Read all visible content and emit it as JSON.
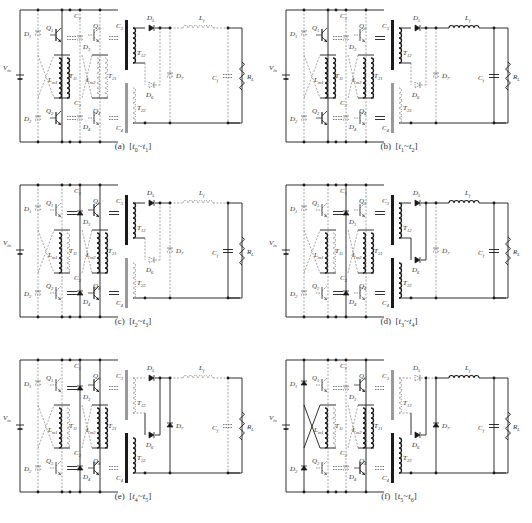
{
  "figure": {
    "panels": [
      {
        "id": "a",
        "caption": "(a)  [t0~t1]",
        "caption_parts": {
          "label": "(a)",
          "t_start": "t",
          "s_start": "0",
          "t_end": "t",
          "s_end": "1"
        },
        "active": {
          "D1": false,
          "D2": false,
          "Q1": true,
          "Q2": true,
          "Q3": false,
          "Q4": false,
          "C1": false,
          "C2": false,
          "C3": false,
          "C4": false,
          "D5": true,
          "D6": false,
          "D7": false,
          "L1": false,
          "Cf": false,
          "T12": true,
          "T22": false,
          "T21": false,
          "cross": false
        }
      },
      {
        "id": "b",
        "caption": "(b)  [t1~t2]",
        "caption_parts": {
          "label": "(b)",
          "t_start": "t",
          "s_start": "1",
          "t_end": "t",
          "s_end": "2"
        },
        "active": {
          "D1": false,
          "D2": false,
          "Q1": true,
          "Q2": true,
          "Q3": false,
          "Q4": false,
          "C1": false,
          "C2": false,
          "C3": true,
          "C4": true,
          "D5": true,
          "D6": false,
          "D7": false,
          "L1": true,
          "Cf": true,
          "T12": true,
          "T22": false,
          "T21": true,
          "cross": false
        }
      },
      {
        "id": "c",
        "caption": "(c)  [t2~t3]",
        "caption_parts": {
          "label": "(c)",
          "t_start": "t",
          "s_start": "2",
          "t_end": "t",
          "s_end": "3"
        },
        "active": {
          "D1": false,
          "D2": false,
          "Q1": false,
          "Q2": false,
          "Q3": true,
          "Q4": true,
          "C1": true,
          "C2": true,
          "C3": true,
          "C4": true,
          "D5": true,
          "D6": false,
          "D7": false,
          "L1": false,
          "Cf": true,
          "T12": true,
          "T22": false,
          "T21": true,
          "cross": false
        }
      },
      {
        "id": "d",
        "caption": "(d)  [t3~t4]",
        "caption_parts": {
          "label": "(d)",
          "t_start": "t",
          "s_start": "3",
          "t_end": "t",
          "s_end": "4"
        },
        "active": {
          "D1": false,
          "D2": false,
          "Q1": false,
          "Q2": false,
          "Q3": false,
          "Q4": false,
          "C1": true,
          "C2": true,
          "C3": true,
          "C4": true,
          "D5": true,
          "D6": true,
          "D7": false,
          "L1": true,
          "Cf": true,
          "T12": true,
          "T22": true,
          "T21": true,
          "cross": false
        }
      },
      {
        "id": "e",
        "caption": "(e)  [t4~t5]",
        "caption_parts": {
          "label": "(e)",
          "t_start": "t",
          "s_start": "4",
          "t_end": "t",
          "s_end": "5"
        },
        "active": {
          "D1": false,
          "D2": false,
          "Q1": false,
          "Q2": false,
          "Q3": true,
          "Q4": true,
          "C1": true,
          "C2": true,
          "C3": false,
          "C4": false,
          "D5": true,
          "D6": true,
          "D7": true,
          "L1": false,
          "Cf": false,
          "T12": false,
          "T22": true,
          "T21": true,
          "cross": false
        }
      },
      {
        "id": "f",
        "caption": "(f)  [t5~t6]",
        "caption_parts": {
          "label": "(f)",
          "t_start": "t",
          "s_start": "5",
          "t_end": "t",
          "s_end": "6"
        },
        "active": {
          "D1": true,
          "D2": true,
          "Q1": false,
          "Q2": false,
          "Q3": true,
          "Q4": true,
          "C1": false,
          "C2": false,
          "C3": false,
          "C4": false,
          "D5": false,
          "D6": true,
          "D7": true,
          "L1": true,
          "Cf": true,
          "T12": false,
          "T22": true,
          "T21": true,
          "cross": true
        }
      }
    ],
    "component_labels": {
      "vin": "V",
      "vin_sub": "in",
      "Q1": "Q",
      "Q1_sub": "1",
      "Q2": "Q",
      "Q2_sub": "2",
      "Q3": "Q",
      "Q3_sub": "3",
      "Q4": "Q",
      "Q4_sub": "4",
      "D1": "D",
      "D1_sub": "1",
      "D2": "D",
      "D2_sub": "2",
      "D3": "D",
      "D3_sub": "3",
      "D4": "D",
      "D4_sub": "4",
      "D5": "D",
      "D5_sub": "5",
      "D6": "D",
      "D6_sub": "6",
      "D7": "D",
      "D7_sub": "7",
      "C1": "C",
      "C1_sub": "1",
      "C2": "C",
      "C2_sub": "2",
      "C3": "C",
      "C3_sub": "3",
      "C4": "C",
      "C4_sub": "4",
      "T11": "T",
      "T11_sub": "11",
      "T21": "T",
      "T21_sub": "21",
      "T12": "T",
      "T12_sub": "12",
      "T22": "T",
      "T22_sub": "22",
      "Lm1": "L",
      "Lm1_sub": "m1",
      "Lm2": "L",
      "Lm2_sub": "m2",
      "L1": "L",
      "L1_sub": "f",
      "Cf": "C",
      "Cf_sub": "f",
      "RL": "R",
      "RL_sub": "L"
    },
    "colors": {
      "solid": "#1a1a1a",
      "dashed": "#6a6a6a",
      "background": "#ffffff"
    }
  }
}
